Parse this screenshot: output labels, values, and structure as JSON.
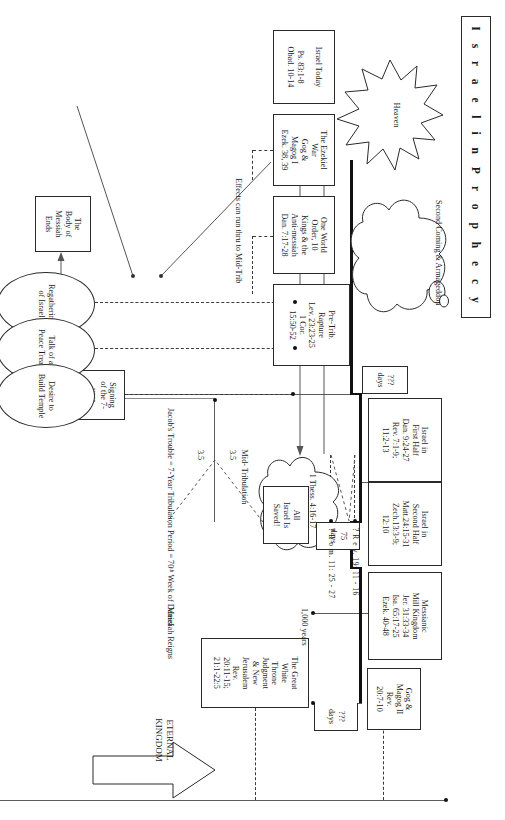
{
  "title": "I s r a e l   i n   P r o p h e c y",
  "heaven": {
    "label": "Heaven"
  },
  "second_coming_cloud": {
    "l1": "Second",
    "l2": "Coming &",
    "l3": "Armageddon"
  },
  "rapture_cloud": {
    "l1": "1 Thess.",
    "l2": "4:16-17"
  },
  "eternal_kingdom": {
    "l1": "ETERNAL",
    "l2": "KINGDOM"
  },
  "timeline_boxes": [
    {
      "name": "israel-today",
      "lines": [
        "Israel Today",
        "",
        "Ps. 83:1-8",
        "Obad. 10-14"
      ]
    },
    {
      "name": "ezekiel-war",
      "lines": [
        "The Ezekiel",
        "War",
        "Gog &",
        "Magog I",
        "Ezek. 38, 39"
      ]
    },
    {
      "name": "one-world-order",
      "lines": [
        "One World",
        "Order, 10",
        "Kings & the",
        "Anti-messiah",
        "Dan. 7:17-28"
      ]
    },
    {
      "name": "pre-trib-rapture",
      "lines": [
        "Pre-Trib.",
        "Rapture",
        "Lev. 23:23-25",
        "1 Cor.",
        "15:50-52"
      ]
    },
    {
      "name": "israel-first-half",
      "lines": [
        "Israel in",
        "First Half",
        "Dan. 9:24-27",
        "Rev. 7:1-9;",
        "11:2-13"
      ]
    },
    {
      "name": "israel-second-half",
      "lines": [
        "Israel in",
        "Second Half",
        "Matt.24:15-31",
        "Zech.13:3-9;",
        "12:10"
      ]
    },
    {
      "name": "messianic-kingdom",
      "lines": [
        "Messianic",
        "Mill Kingdom",
        "Jer. 31:33-34",
        "Isa. 65:17-25",
        "Ezek. 40-48"
      ]
    },
    {
      "name": "gog-magog-two",
      "lines": [
        "Gog &",
        "Magog II",
        "Rev.",
        "20:7-10"
      ]
    },
    {
      "name": "great-white-throne",
      "lines": [
        "The Great",
        "White",
        "Throne",
        "Judgment",
        "& New",
        "Jerusalem",
        "Rev.",
        "20:11-15;",
        "21:1-22:5"
      ]
    }
  ],
  "callout_boxes": [
    {
      "name": "all-israel-saved",
      "lines": [
        "All",
        "Israel Is",
        "Saved!"
      ]
    },
    {
      "name": "signing-treaty",
      "lines": [
        "Signing",
        "of the 7-",
        "year",
        "peace",
        "treaty"
      ]
    },
    {
      "name": "body-of-messiah",
      "lines": [
        "The",
        "Body of",
        "Messiah",
        "Ends"
      ]
    }
  ],
  "ellipses": [
    {
      "name": "regathering-of-israel",
      "l1": "Regathering",
      "l2": "of Israel"
    },
    {
      "name": "talk-of-peace-treaty",
      "l1": "Talk of a",
      "l2": "Peace Treaty"
    },
    {
      "name": "desire-build-temple",
      "l1": "Desire to",
      "l2": "Build Temple"
    }
  ],
  "durations": {
    "days_unknown_trib": "???",
    "days_unknown_trib_unit": "days",
    "days_75": "75",
    "days_75_unit": "days",
    "thousand_years": "1,000 years",
    "days_unknown_end": "???",
    "days_unknown_end_unit": "days",
    "half_one": "3.5",
    "half_two": "3.5"
  },
  "notes": {
    "effects_run": "Effects can run thru to Mid-Trib",
    "mid_trib_l1": "Mid-",
    "mid_trib_l2": "Tribulation",
    "messiah_reigns_l1": "Messiah",
    "messiah_reigns_l2": "Reigns",
    "pentecost": "(Goes back to Pentecost 2,000 years ago)"
  },
  "jacobs_trouble": {
    "l1": "Jacob's",
    "l2": "Trouble =",
    "l3": "7-Year",
    "l4": "Tribulation",
    "l5": "Period =",
    "l6": "70ᵗʰ Week of",
    "l7": "Daniel"
  },
  "refs_stacked": {
    "rev_marker": "?",
    "rev": "R e v. 19: 11 - 16",
    "rom_marker": "?",
    "rom": "R o m. 11: 25 - 27"
  },
  "bottom_notes": [
    {
      "name": "israeli-arab-wars",
      "lines": [
        "Israeli-Arab",
        "Wars & the",
        "Everlasting",
        "Enmity",
        "(Ezek. 35)"
      ]
    },
    {
      "name": "russia-confederacy",
      "lines": [
        "Russia & the",
        "Confederacy",
        "invade Israel"
      ]
    },
    {
      "name": "daniels-fourth-beast",
      "lines": [
        "Daniel's Fourth",
        "Beast (Dan.",
        "2:31-45;",
        "11:36-45)"
      ]
    }
  ],
  "colors": {
    "ink": "#1b1b1b",
    "rule": "#5c5c5c",
    "thick_rule": "#111111",
    "paper": "#ffffff"
  }
}
